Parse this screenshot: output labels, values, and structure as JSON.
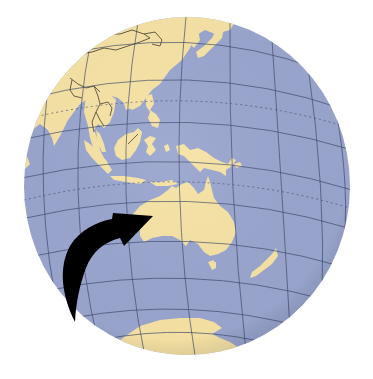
{
  "figure": {
    "description": "Orthographic globe centered on Australia with a black curved arrow pointing to Australia",
    "visible_text": []
  },
  "globe": {
    "center_x": 187,
    "center_y": 186,
    "radius": 164,
    "ocean_color": "#9aa6cf",
    "land_color": "#f7e3a5",
    "grid_color": "#3c4868",
    "border_color": "#3a3326"
  },
  "regions": [
    {
      "name": "Asia (China / Mongolia / Russia)"
    },
    {
      "name": "India"
    },
    {
      "name": "Southeast Asia"
    },
    {
      "name": "Japan"
    },
    {
      "name": "Philippines"
    },
    {
      "name": "Borneo"
    },
    {
      "name": "Sumatra"
    },
    {
      "name": "Java"
    },
    {
      "name": "Sulawesi"
    },
    {
      "name": "New Guinea"
    },
    {
      "name": "Australia"
    },
    {
      "name": "Tasmania"
    },
    {
      "name": "New Zealand"
    },
    {
      "name": "Antarctica"
    }
  ],
  "arrow": {
    "color": "#000000",
    "target": "Australia"
  }
}
